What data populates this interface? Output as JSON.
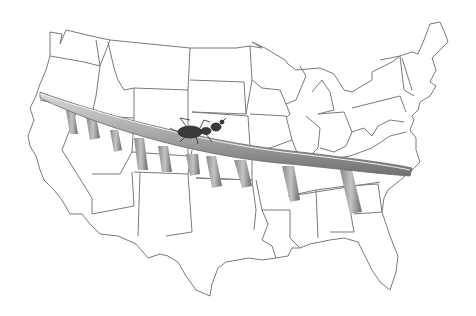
{
  "image": {
    "description": "Pencil illustration of an ant walking across a long bridge spanning the continental United States outline map",
    "subjects": [
      "us-map-outline",
      "bridge",
      "ant"
    ],
    "colors": {
      "background": "#ffffff",
      "map_lines": "#7a7a7a",
      "bridge_dark": "#6e6e6e",
      "bridge_light": "#c8c8c8",
      "ant": "#3a3a3a"
    }
  }
}
